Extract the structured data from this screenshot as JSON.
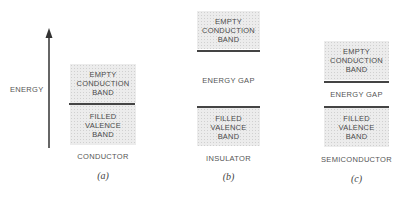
{
  "axis": {
    "label": "ENERGY",
    "direction": "up"
  },
  "panels": [
    {
      "name": "CONDUCTOR",
      "caption": "(a)",
      "conduction": "EMPTY\nCONDUCTION\nBAND",
      "valence": "FILLED\nVALENCE\nBAND",
      "gap": ""
    },
    {
      "name": "INSULATOR",
      "caption": "(b)",
      "conduction": "EMPTY\nCONDUCTION\nBAND",
      "valence": "FILLED\nVALENCE\nBAND",
      "gap": "ENERGY GAP"
    },
    {
      "name": "SEMICONDUCTOR",
      "caption": "(c)",
      "conduction": "EMPTY\nCONDUCTION\nBAND",
      "valence": "FILLED\nVALENCE\nBAND",
      "gap": "ENERGY GAP"
    }
  ]
}
